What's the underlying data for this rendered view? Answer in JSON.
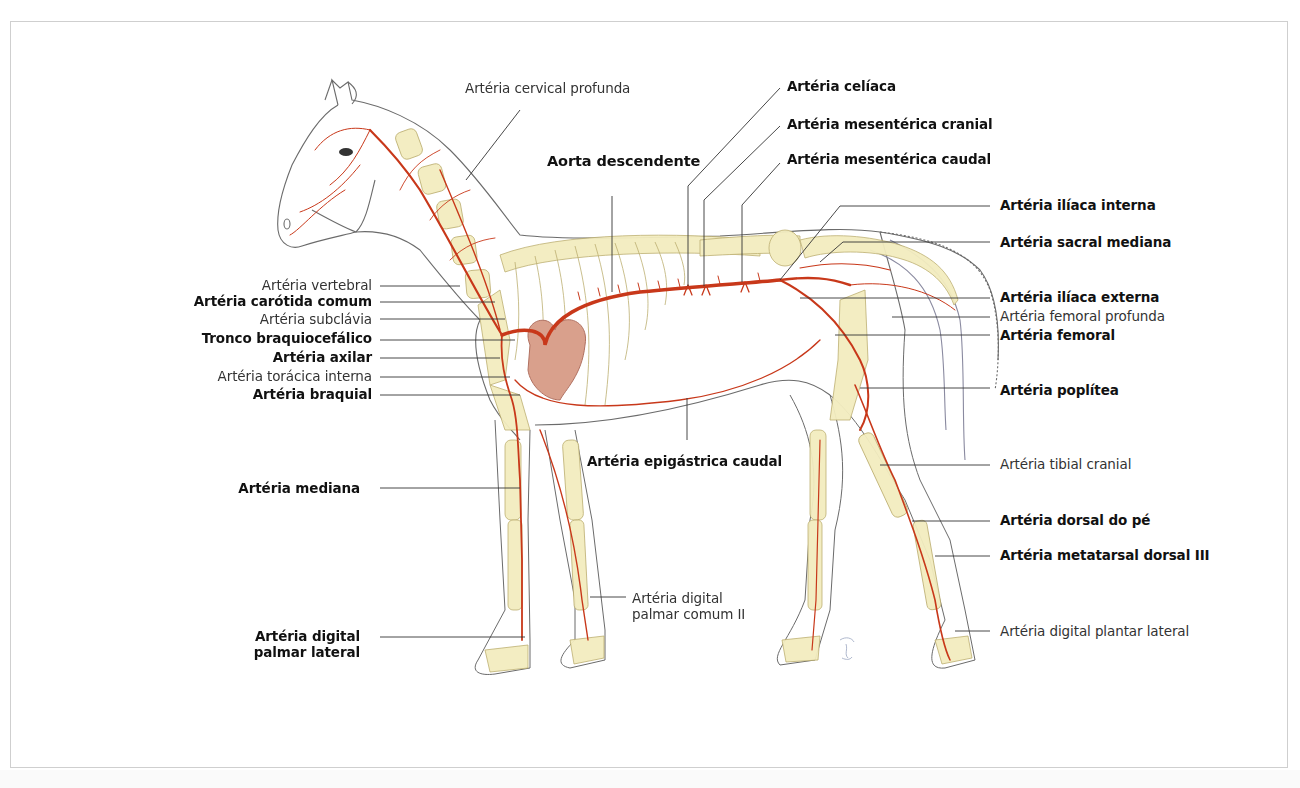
{
  "figure": {
    "colors": {
      "artery": "#c8381a",
      "bone": "#f3ecbf",
      "bone_stroke": "#b9ab6a",
      "outline": "#6b6b6b",
      "heart": "#d9a08c",
      "frame": "#cfcfcf",
      "leader": "#333333"
    }
  },
  "labels": {
    "cervical_profunda": "Artéria cervical profunda",
    "aorta_descendente": "Aorta descendente",
    "celiaca": "Artéria celíaca",
    "mesenterica_cranial": "Artéria mesentérica cranial",
    "mesenterica_caudal": "Artéria mesentérica caudal",
    "iliaca_interna": "Artéria ilíaca interna",
    "sacral_mediana": "Artéria sacral mediana",
    "iliaca_externa": "Artéria ilíaca externa",
    "femoral_profunda": "Artéria femoral profunda",
    "femoral": "Artéria femoral",
    "poplitea": "Artéria poplítea",
    "tibial_cranial": "Artéria tibial cranial",
    "dorsal_pe": "Artéria dorsal do pé",
    "metatarsal_dorsal": "Artéria metatarsal dorsal III",
    "digital_plantar_lateral": "Artéria digital plantar lateral",
    "vertebral": "Artéria vertebral",
    "carotida_comum": "Artéria carótida comum",
    "subclavia": "Artéria subclávia",
    "braquiocefalico": "Tronco braquiocefálico",
    "axilar": "Artéria axilar",
    "toracica_interna": "Artéria torácica interna",
    "braquial": "Artéria braquial",
    "mediana": "Artéria mediana",
    "epigastrica_caudal": "Artéria epigástrica caudal",
    "digital_palmar_comum_1": "Artéria digital",
    "digital_palmar_comum_2": "palmar comum II",
    "digital_palmar_lateral_1": "Artéria digital",
    "digital_palmar_lateral_2": "palmar lateral"
  }
}
